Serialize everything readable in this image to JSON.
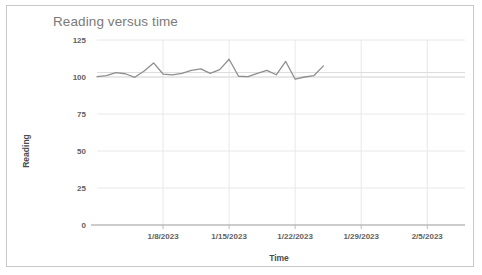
{
  "card": {
    "border_color": "#c8c8c8",
    "background": "#ffffff"
  },
  "chart_data": {
    "type": "line",
    "title": "Reading versus time",
    "xlabel": "Time",
    "ylabel": "Reading",
    "grid": true,
    "legend": "none",
    "title_color": "#7a7a7a",
    "line_color": "#8e8e8e",
    "gridline_color": "#e8e8e8",
    "axis_color": "#999999",
    "ylim": [
      0,
      125
    ],
    "yticks": [
      0,
      25,
      50,
      75,
      100,
      125
    ],
    "ytick_labels": [
      "0",
      "25",
      "50",
      "75",
      "100",
      "125"
    ],
    "xtick_labels": [
      "1/8/2023",
      "1/15/2023",
      "1/22/2023",
      "1/29/2023",
      "2/5/2023"
    ],
    "xlim": [
      "1/1/2023",
      "2/9/2023"
    ],
    "x": [
      "1/1/2023",
      "1/2/2023",
      "1/3/2023",
      "1/4/2023",
      "1/5/2023",
      "1/6/2023",
      "1/7/2023",
      "1/8/2023",
      "1/9/2023",
      "1/10/2023",
      "1/11/2023",
      "1/12/2023",
      "1/13/2023",
      "1/14/2023",
      "1/15/2023",
      "1/16/2023",
      "1/17/2023",
      "1/18/2023",
      "1/19/2023",
      "1/20/2023",
      "1/21/2023",
      "1/22/2023",
      "1/23/2023",
      "1/24/2023"
    ],
    "values": [
      100.2,
      101.0,
      103.0,
      102.2,
      99.8,
      104.0,
      109.5,
      102.0,
      101.5,
      102.5,
      104.5,
      105.5,
      102.5,
      105.0,
      112.0,
      100.5,
      100.3,
      102.5,
      104.5,
      101.5,
      110.5,
      98.5,
      100.0,
      101.0
    ],
    "reference_lines": [
      {
        "name": "lower-reference-line",
        "value": 100.0
      },
      {
        "name": "upper-reference-line",
        "value": 103.0
      }
    ],
    "series_end_value": 107.5
  }
}
